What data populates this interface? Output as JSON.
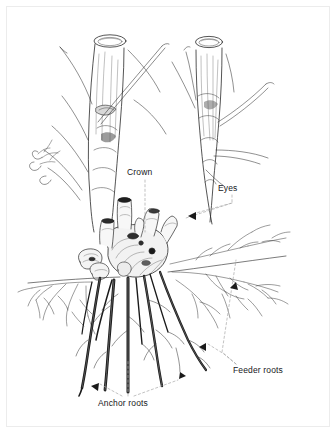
{
  "figure": {
    "kind": "botanical-line-illustration",
    "medium": "pen-and-ink hatched drawing",
    "background_color": "#ffffff",
    "ink_color": "#1a1a1a",
    "frame_color": "#ececec",
    "leader_color": "#9a9a9a"
  },
  "labels": [
    {
      "id": "crown",
      "text": "Crown",
      "leader": "vertical dashed line descending to the knotty central crown"
    },
    {
      "id": "eyes",
      "text": "Eyes",
      "leader": "dashed bracket with arrowhead pointing to the bud eyes on the crown"
    },
    {
      "id": "feeder-roots",
      "text": "Feeder roots",
      "leader": "dashed bracket with arrowheads pointing to the fine branching roots"
    },
    {
      "id": "anchor-roots",
      "text": "Anchor roots",
      "leader": "dashed bracket with arrowheads pointing to the thick descending roots"
    }
  ]
}
